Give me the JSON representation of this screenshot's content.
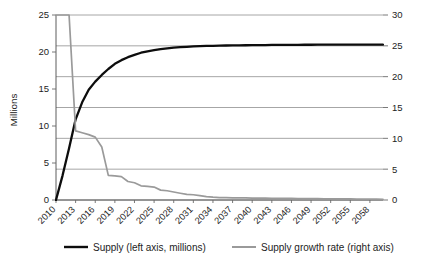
{
  "chart_data": {
    "type": "line",
    "title": "",
    "xlabel": "",
    "ylabel": "Millions",
    "y2label": "",
    "grid": true,
    "legend_position": "bottom",
    "x": [
      2010,
      2011,
      2012,
      2013,
      2014,
      2015,
      2016,
      2017,
      2018,
      2019,
      2020,
      2021,
      2022,
      2023,
      2024,
      2025,
      2026,
      2027,
      2028,
      2029,
      2030,
      2031,
      2032,
      2033,
      2034,
      2035,
      2036,
      2037,
      2038,
      2039,
      2040,
      2041,
      2042,
      2043,
      2044,
      2045,
      2046,
      2047,
      2048,
      2049,
      2050,
      2051,
      2052,
      2053,
      2054,
      2055,
      2056,
      2057,
      2058,
      2059,
      2060
    ],
    "xtick_labels": [
      "2010",
      "2013",
      "2016",
      "2019",
      "2022",
      "2025",
      "2028",
      "2031",
      "2034",
      "2037",
      "2040",
      "2043",
      "2046",
      "2049",
      "2052",
      "2055",
      "2058"
    ],
    "xtick_values": [
      2010,
      2013,
      2016,
      2019,
      2022,
      2025,
      2028,
      2031,
      2034,
      2037,
      2040,
      2043,
      2046,
      2049,
      2052,
      2055,
      2058
    ],
    "ylim": [
      0,
      25
    ],
    "ytick_labels": [
      "0",
      "5",
      "10",
      "15",
      "20",
      "25"
    ],
    "ytick_values": [
      0,
      5,
      10,
      15,
      20,
      25
    ],
    "y2lim": [
      0,
      30
    ],
    "y2tick_labels": [
      "0",
      "5",
      "10",
      "15",
      "20",
      "25",
      "30"
    ],
    "y2tick_values": [
      0,
      5,
      10,
      15,
      20,
      25,
      30
    ],
    "series": [
      {
        "name": "Supply (left axis, millions)",
        "axis": "left",
        "color": "#0d0d0d",
        "values": [
          0.0,
          3.3,
          7.0,
          10.9,
          13.2,
          14.9,
          16.0,
          16.9,
          17.7,
          18.4,
          18.9,
          19.3,
          19.6,
          19.9,
          20.1,
          20.25,
          20.4,
          20.5,
          20.6,
          20.65,
          20.7,
          20.75,
          20.8,
          20.82,
          20.84,
          20.86,
          20.88,
          20.9,
          20.9,
          20.91,
          20.92,
          20.93,
          20.94,
          20.95,
          20.95,
          20.96,
          20.97,
          20.97,
          20.98,
          20.98,
          20.99,
          20.99,
          21.0,
          21.0,
          21.0,
          21.0,
          21.0,
          21.0,
          21.0,
          21.0,
          21.0
        ]
      },
      {
        "name": "Supply growth rate (right axis)",
        "axis": "right",
        "color": "#9a9a9a",
        "values": [
          30.0,
          30.0,
          30.0,
          11.2,
          10.9,
          10.6,
          10.2,
          8.6,
          4.0,
          3.9,
          3.8,
          3.0,
          2.8,
          2.3,
          2.2,
          2.1,
          1.6,
          1.5,
          1.3,
          1.1,
          0.9,
          0.85,
          0.7,
          0.55,
          0.45,
          0.4,
          0.38,
          0.36,
          0.35,
          0.33,
          0.32,
          0.3,
          0.3,
          0.28,
          0.27,
          0.26,
          0.25,
          0.24,
          0.23,
          0.22,
          0.21,
          0.2,
          0.2,
          0.19,
          0.18,
          0.17,
          0.16,
          0.15,
          0.14,
          0.13,
          0.12
        ]
      }
    ],
    "legend": [
      {
        "label": "Supply (left axis, millions)",
        "color": "#0d0d0d"
      },
      {
        "label": "Supply growth rate (right axis)",
        "color": "#9a9a9a"
      }
    ]
  }
}
